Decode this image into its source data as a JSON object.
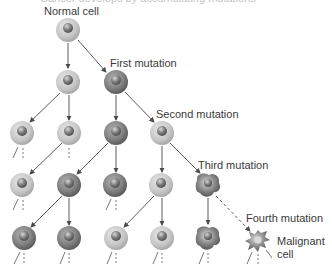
{
  "title_cut": "Cancer develops by accumulating mutations",
  "labels": {
    "normal": "Normal cell",
    "first": "First mutation",
    "second": "Second mutation",
    "third": "Third mutation",
    "fourth": "Fourth mutation",
    "malignant_1": "Malignant",
    "malignant_2": "cell"
  },
  "colors": {
    "light_cell": "#c9c9c9",
    "dark_cell": "#8c8c8c",
    "nucleus": "#7a7a7a",
    "arrow": "#4a4a4a",
    "text": "#3a3a3a"
  },
  "cells": [
    {
      "x": 68,
      "y": 30,
      "type": "light"
    },
    {
      "x": 68,
      "y": 82,
      "type": "light"
    },
    {
      "x": 116,
      "y": 82,
      "type": "dark"
    },
    {
      "x": 22,
      "y": 133,
      "type": "light"
    },
    {
      "x": 69,
      "y": 133,
      "type": "light"
    },
    {
      "x": 116,
      "y": 133,
      "type": "dark"
    },
    {
      "x": 162,
      "y": 133,
      "type": "light"
    },
    {
      "x": 22,
      "y": 185,
      "type": "light"
    },
    {
      "x": 69,
      "y": 185,
      "type": "dark"
    },
    {
      "x": 115,
      "y": 185,
      "type": "dark"
    },
    {
      "x": 161,
      "y": 185,
      "type": "light"
    },
    {
      "x": 24,
      "y": 238,
      "type": "dark"
    },
    {
      "x": 69,
      "y": 238,
      "type": "dark"
    },
    {
      "x": 116,
      "y": 238,
      "type": "light"
    },
    {
      "x": 162,
      "y": 238,
      "type": "light"
    }
  ],
  "irregular_cells": [
    {
      "x": 208,
      "y": 185
    },
    {
      "x": 208,
      "y": 238
    }
  ],
  "malignant": {
    "x": 258,
    "y": 240
  }
}
